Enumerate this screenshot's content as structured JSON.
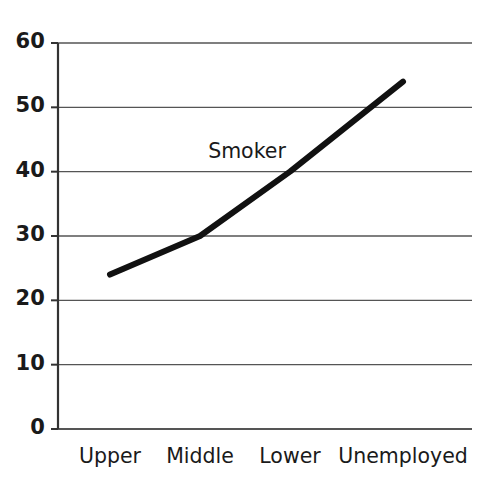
{
  "chart_data": {
    "type": "line",
    "title": "",
    "subtitle": "",
    "xlabel": "",
    "ylabel": "",
    "categories": [
      "Upper",
      "Middle",
      "Lower",
      "Unemployed"
    ],
    "series": [
      {
        "name": "Smoker",
        "values": [
          24,
          30,
          40,
          54
        ],
        "color": "#111111",
        "line_width": 6,
        "markers": false
      }
    ],
    "ylim": [
      0,
      60
    ],
    "yticks": [
      0,
      10,
      20,
      30,
      40,
      50,
      60
    ],
    "ytick_labels": [
      "0",
      "10",
      "20",
      "30",
      "40",
      "50",
      "60"
    ],
    "grid": true,
    "grid_axis": "y",
    "grid_color": "#555555",
    "axis_color": "#333333",
    "legend": "none",
    "annotations": [
      {
        "text": "Smoker",
        "x_category": "Middle",
        "value": 43,
        "name": "series-annotation-smoker"
      }
    ]
  },
  "layout": {
    "plot_left": 58,
    "plot_right": 472,
    "plot_top": 43,
    "plot_bottom": 429,
    "x_positions": [
      110,
      200,
      290,
      403
    ],
    "annotation_x": 247,
    "annotation_y": 153
  }
}
